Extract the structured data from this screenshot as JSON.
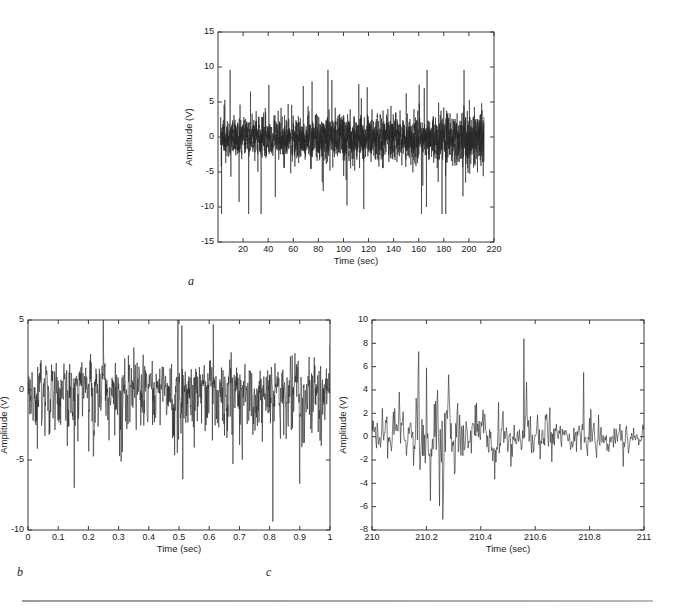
{
  "figure": {
    "background_color": "#ffffff",
    "line_color": "#262626",
    "axis_color": "#3a3a3a",
    "rule_color": "#9a9a9a"
  },
  "captions": {
    "a": "a",
    "b": "b",
    "c": "c"
  },
  "chart_data": [
    {
      "id": "panel-a",
      "type": "line",
      "title": "",
      "xlabel": "Time (sec)",
      "ylabel": "Amplitude (V)",
      "xlim": [
        0,
        220
      ],
      "ylim": [
        -15,
        15
      ],
      "xticks": [
        20,
        40,
        60,
        80,
        100,
        120,
        140,
        160,
        180,
        200,
        220
      ],
      "xticklabels": [
        "20",
        "40",
        "60",
        "80",
        "100",
        "120",
        "140",
        "160",
        "180",
        "200",
        "220"
      ],
      "yticks": [
        -15,
        -10,
        -5,
        0,
        5,
        10,
        15
      ],
      "yticklabels": [
        "-15",
        "-10",
        "-5",
        "0",
        "5",
        "10",
        "15"
      ],
      "grid": false,
      "legend": null,
      "series": [
        {
          "name": "raw vibration signal",
          "x_start": 2,
          "x_end": 212,
          "n_points": 3400,
          "envelope_start": 6.0,
          "envelope_end": 7.6,
          "peak_max": 9.6,
          "peak_min": -11.0,
          "description": "Dense broadband noise-like vibration signal filling the band roughly -8 to +8 V, with slowly growing amplitude toward the right and occasional spikes reaching +9.6 V and -11 V."
        }
      ]
    },
    {
      "id": "panel-b",
      "type": "line",
      "title": "",
      "xlabel": "Time (sec)",
      "ylabel": "Amplitude (V)",
      "xlim": [
        0,
        1
      ],
      "ylim": [
        -10,
        5
      ],
      "xticks": [
        0,
        0.1,
        0.2,
        0.3,
        0.4,
        0.5,
        0.6,
        0.7,
        0.8,
        0.9,
        1
      ],
      "xticklabels": [
        "0",
        "0.1",
        "0.2",
        "0.3",
        "0.4",
        "0.5",
        "0.6",
        "0.7",
        "0.8",
        "0.9",
        "1"
      ],
      "yticks": [
        -10,
        -5,
        0,
        5
      ],
      "yticklabels": [
        "-10",
        "-5",
        "0",
        "5"
      ],
      "grid": false,
      "legend": null,
      "series": [
        {
          "name": "1 second segment (0 to 1 sec)",
          "x_start": 0,
          "x_end": 1,
          "n_points": 1000,
          "envelope_start": 3.0,
          "envelope_end": 3.0,
          "peak_max": 5.0,
          "peak_min": -9.4,
          "description": "One-second window of the same signal, clipped at the 5 V top of the axis, with sharp asymmetric downward impulses down to about -9.4 V occurring irregularly."
        }
      ]
    },
    {
      "id": "panel-c",
      "type": "line",
      "title": "",
      "xlabel": "Time (sec)",
      "ylabel": "Amplitude (V)",
      "xlim": [
        210,
        211
      ],
      "ylim": [
        -8,
        10
      ],
      "xticks": [
        210,
        210.2,
        210.4,
        210.6,
        210.8,
        211
      ],
      "xticklabels": [
        "210",
        "210.2",
        "210.4",
        "210.6",
        "210.8",
        "211"
      ],
      "yticks": [
        -8,
        -6,
        -4,
        -2,
        0,
        2,
        4,
        6,
        8,
        10
      ],
      "yticklabels": [
        "-8",
        "-6",
        "-4",
        "-2",
        "0",
        "2",
        "4",
        "6",
        "8",
        "10"
      ],
      "grid": false,
      "legend": null,
      "series": [
        {
          "name": "1 second segment (210 to 211 sec)",
          "x_start": 210,
          "x_end": 211,
          "n_points": 420,
          "envelope_start": 2.2,
          "envelope_end": 1.4,
          "peak_max": 8.4,
          "peak_min": -7.1,
          "description": "One-second window late in the record showing a high-amplitude burst between 210.15 and 210.33 sec with peaks near +8.4 V and -7.1 V, settling to roughly +/-2 V after 210.85 sec."
        }
      ]
    }
  ]
}
